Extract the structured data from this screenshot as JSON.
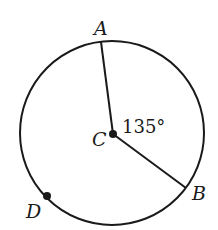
{
  "diagram": {
    "type": "circle-geometry",
    "circle": {
      "cx": 112,
      "cy": 133,
      "r": 92,
      "stroke": "#1a1a1a"
    },
    "center": {
      "label": "C",
      "x": 113,
      "y": 134
    },
    "points": [
      {
        "label": "A",
        "x": 101,
        "y": 42
      },
      {
        "label": "B",
        "x": 186,
        "y": 188
      },
      {
        "label": "D",
        "x": 47,
        "y": 196
      }
    ],
    "radii": [
      {
        "from": "C",
        "to": "A"
      },
      {
        "from": "C",
        "to": "B"
      }
    ],
    "angle": {
      "vertex": "C",
      "between": [
        "A",
        "B"
      ],
      "value": "135°"
    }
  },
  "labels": {
    "A": "A",
    "B": "B",
    "C": "C",
    "D": "D",
    "angle": "135°"
  }
}
